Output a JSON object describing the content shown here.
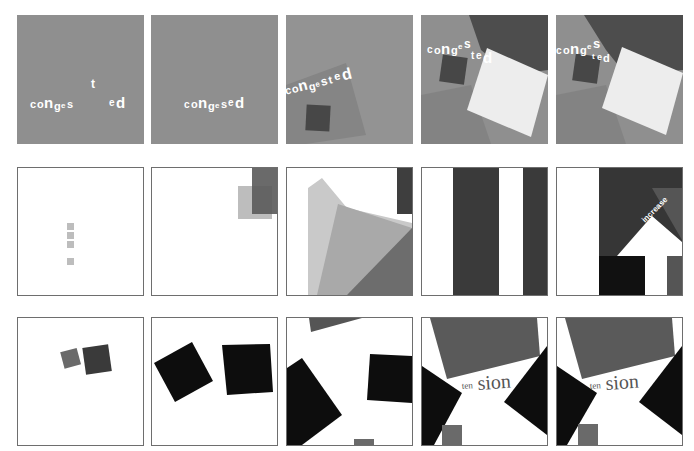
{
  "figure": {
    "rows": [
      {
        "name": "congested-series",
        "panels": [
          {
            "id": "r1p1",
            "word_parts": [
              "c",
              "o",
              "n",
              "g",
              "e",
              "s",
              "t",
              "e",
              "d"
            ],
            "label": "congested"
          },
          {
            "id": "r1p2",
            "label": "congested"
          },
          {
            "id": "r1p3",
            "label": "congested"
          },
          {
            "id": "r1p4",
            "label": "congested"
          },
          {
            "id": "r1p5",
            "label": "congested"
          }
        ]
      },
      {
        "name": "increase-series",
        "panels": [
          {
            "id": "r2p1"
          },
          {
            "id": "r2p2"
          },
          {
            "id": "r2p3"
          },
          {
            "id": "r2p4"
          },
          {
            "id": "r2p5",
            "label": "increase"
          }
        ]
      },
      {
        "name": "tension-series",
        "panels": [
          {
            "id": "r3p1"
          },
          {
            "id": "r3p2"
          },
          {
            "id": "r3p3"
          },
          {
            "id": "r3p4",
            "label_small": "ten",
            "label_large": "sion"
          },
          {
            "id": "r3p5",
            "label_small": "ten",
            "label_large": "sion"
          }
        ]
      }
    ],
    "colors": {
      "mid_gray": "#8f8f8f",
      "light_gray": "#b8b8b8",
      "dark_gray": "#4a4a4a",
      "darker_gray": "#333333",
      "near_black": "#0d0d0d",
      "white": "#ffffff",
      "off_white": "#efefef",
      "frame": "#6e6e6e"
    }
  }
}
